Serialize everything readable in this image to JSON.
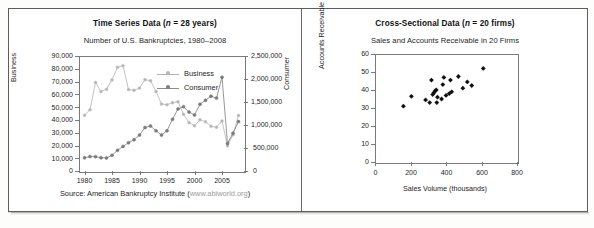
{
  "figure": {
    "panels": [
      {
        "id": "time-series",
        "title_main": "Time Series Data (",
        "title_italic": "n",
        "title_tail": " = 28 years)",
        "subtitle": "Number of U.S. Bankruptcies, 1980–2008",
        "source_text": "Source: American Bankruptcy Institute (",
        "source_url": "www.abiworld.org",
        "source_tail": ")",
        "legend": [
          {
            "label": "Business",
            "color": "#b3b3b3"
          },
          {
            "label": "Consumer",
            "color": "#7d7d7d"
          }
        ]
      },
      {
        "id": "cross-sectional",
        "title_main": "Cross-Sectional Data (",
        "title_italic": "n",
        "title_tail": " = 20 firms)",
        "subtitle": "Sales and Accounts Receivable in 20 Firms"
      }
    ]
  },
  "chart_data": [
    {
      "type": "line",
      "id": "time-series",
      "title": "Number of U.S. Bankruptcies, 1980–2008",
      "xlabel": "",
      "ylabel": "Business",
      "y2label": "Consumer",
      "xlim": [
        1979,
        2009
      ],
      "ylim": [
        0,
        90000
      ],
      "y2lim": [
        0,
        2500000
      ],
      "xticks": [
        1980,
        1985,
        1990,
        1995,
        2000,
        2005
      ],
      "xtick_labels": [
        "1980",
        "1985",
        "1990",
        "1995",
        "2000",
        "2005"
      ],
      "yticks": [
        0,
        10000,
        20000,
        30000,
        40000,
        50000,
        60000,
        70000,
        80000,
        90000
      ],
      "ytick_labels": [
        "0",
        "10,000",
        "20,000",
        "30,000",
        "40,000",
        "50,000",
        "60,000",
        "70,000",
        "80,000",
        "90,000"
      ],
      "y2ticks": [
        0,
        500000,
        1000000,
        1500000,
        2000000,
        2500000
      ],
      "y2tick_labels": [
        "0",
        "500,000",
        "1,000,000",
        "1,500,000",
        "2,000,000",
        "2,500,000"
      ],
      "grid": false,
      "legend_position": "upper-right",
      "x": [
        1980,
        1981,
        1982,
        1983,
        1984,
        1985,
        1986,
        1987,
        1988,
        1989,
        1990,
        1991,
        1992,
        1993,
        1994,
        1995,
        1996,
        1997,
        1998,
        1999,
        2000,
        2001,
        2002,
        2003,
        2004,
        2005,
        2006,
        2007,
        2008
      ],
      "series": [
        {
          "name": "Business",
          "axis": "left",
          "color": "#b3b3b3",
          "values": [
            43700,
            48000,
            69300,
            62200,
            64000,
            71300,
            81200,
            82400,
            63800,
            63200,
            64900,
            71500,
            70600,
            62300,
            52400,
            51900,
            53500,
            54200,
            44400,
            37900,
            35500,
            40100,
            38500,
            35000,
            34300,
            39200,
            19700,
            28300,
            43500
          ]
        },
        {
          "name": "Consumer",
          "axis": "right",
          "color": "#7d7d7d",
          "values": [
            287600,
            315100,
            311400,
            289700,
            284500,
            341200,
            449200,
            534200,
            613500,
            679500,
            782900,
            943900,
            979000,
            875200,
            780500,
            874600,
            1125000,
            1350100,
            1398200,
            1281600,
            1217900,
            1452000,
            1539100,
            1625200,
            1584600,
            2039200,
            598000,
            822600,
            1074200
          ]
        }
      ]
    },
    {
      "type": "scatter",
      "id": "cross-sectional",
      "title": "Sales and Accounts Receivable in 20 Firms",
      "xlabel": "Sales Volume (thousands)",
      "ylabel": "Accounts Receivable (thousands)",
      "xlim": [
        0,
        800
      ],
      "ylim": [
        0,
        60
      ],
      "xticks": [
        0,
        200,
        400,
        600,
        800
      ],
      "xtick_labels": [
        "0",
        "200",
        "400",
        "600",
        "800"
      ],
      "yticks": [
        0,
        10,
        20,
        30,
        40,
        50,
        60
      ],
      "ytick_labels": [
        "0",
        "10",
        "20",
        "30",
        "40",
        "50",
        "60"
      ],
      "grid": false,
      "marker": "diamond",
      "marker_color": "#111111",
      "points": [
        {
          "x": 160,
          "y": 31
        },
        {
          "x": 205,
          "y": 36.5
        },
        {
          "x": 285,
          "y": 34.5
        },
        {
          "x": 308,
          "y": 33
        },
        {
          "x": 318,
          "y": 45.5
        },
        {
          "x": 325,
          "y": 37.5
        },
        {
          "x": 332,
          "y": 38.5
        },
        {
          "x": 338,
          "y": 39.5
        },
        {
          "x": 345,
          "y": 40
        },
        {
          "x": 348,
          "y": 33
        },
        {
          "x": 352,
          "y": 36
        },
        {
          "x": 375,
          "y": 35
        },
        {
          "x": 382,
          "y": 43
        },
        {
          "x": 388,
          "y": 47
        },
        {
          "x": 400,
          "y": 37
        },
        {
          "x": 418,
          "y": 38
        },
        {
          "x": 425,
          "y": 45.5
        },
        {
          "x": 432,
          "y": 39
        },
        {
          "x": 470,
          "y": 47.5
        },
        {
          "x": 495,
          "y": 41
        },
        {
          "x": 520,
          "y": 44.5
        },
        {
          "x": 545,
          "y": 42.5
        },
        {
          "x": 610,
          "y": 52
        }
      ]
    }
  ]
}
